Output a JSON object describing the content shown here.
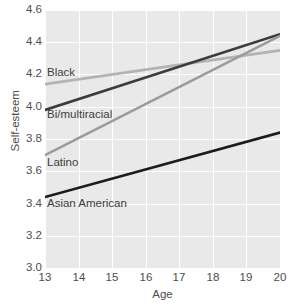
{
  "chart_data": {
    "type": "line",
    "title": "",
    "subtitle": "",
    "xlabel": "Age",
    "ylabel": "Self-esteem",
    "xlim": [
      13,
      20
    ],
    "ylim": [
      3.0,
      4.6
    ],
    "xticks": [
      "13",
      "14",
      "15",
      "16",
      "17",
      "18",
      "19",
      "20"
    ],
    "yticks": [
      "3.0",
      "3.2",
      "3.4",
      "3.6",
      "3.8",
      "4.0",
      "4.2",
      "4.4",
      "4.6"
    ],
    "grid": true,
    "legend_position": "inline-labels",
    "x": [
      13,
      20
    ],
    "series": [
      {
        "name": "Black",
        "values": [
          4.14,
          4.35
        ],
        "color": "#b3b3b3",
        "label_x": 13.05,
        "label_y": 4.21
      },
      {
        "name": "Bi/multiracial",
        "values": [
          3.98,
          4.45
        ],
        "color": "#3c3c3c",
        "label_x": 13.05,
        "label_y": 3.95
      },
      {
        "name": "Latino",
        "values": [
          3.7,
          4.44
        ],
        "color": "#9b9b9b",
        "label_x": 13.05,
        "label_y": 3.65
      },
      {
        "name": "Asian American",
        "values": [
          3.44,
          3.84
        ],
        "color": "#1c1c1c",
        "label_x": 13.05,
        "label_y": 3.4
      }
    ]
  },
  "colors": {
    "plot_background": "#e9e9e9",
    "page_background": "#ffffff",
    "gridline": "#ffffff",
    "tick_label": "#4d4d4d",
    "axis_title": "#4d4d4d",
    "series_label": "#3d3d3d"
  }
}
